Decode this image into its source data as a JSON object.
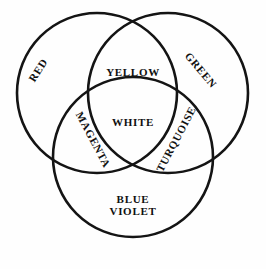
{
  "diagram": {
    "type": "venn",
    "background_color": "#fefefe",
    "stroke_color": "#141414",
    "text_color": "#101010",
    "circles": [
      {
        "id": "red-circle",
        "label": "RED",
        "cx": 97,
        "cy": 93,
        "r": 80
      },
      {
        "id": "green-circle",
        "label": "GREEN",
        "cx": 168,
        "cy": 93,
        "r": 80
      },
      {
        "id": "blue-violet-circle",
        "label_line1": "BLUE",
        "label_line2": "VIOLET",
        "cx": 133,
        "cy": 157,
        "r": 80
      }
    ],
    "regions": {
      "red": "RED",
      "green": "GREEN",
      "blue_violet_line1": "BLUE",
      "blue_violet_line2": "VIOLET",
      "red_green": "YELLOW",
      "red_blue": "MAGENTA",
      "green_blue": "TURQUOISE",
      "all_three": "WHITE"
    }
  }
}
